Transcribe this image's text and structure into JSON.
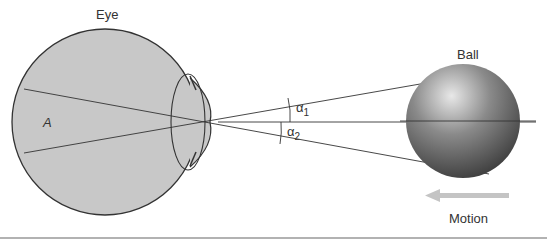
{
  "labels": {
    "eye": "Eye",
    "ball": "Ball",
    "region": "A",
    "angle1": "α",
    "angle1_sub": "1",
    "angle2": "α",
    "angle2_sub": "2",
    "motion": "Motion"
  },
  "colors": {
    "eye_fill": "#c8c8c8",
    "stroke": "#333333",
    "ball_light": "#e6e6e6",
    "ball_dark": "#444444",
    "arrow": "#c4c4c4"
  }
}
